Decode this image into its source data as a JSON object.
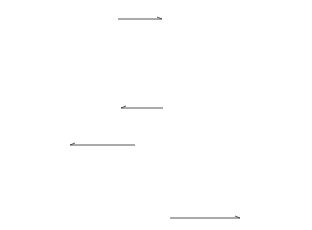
{
  "figure": {
    "colors": {
      "line": "#2a2a2a",
      "dashed": "#6a6a6a",
      "background": "#ffffff"
    },
    "labels": {
      "A": "A",
      "a": "a",
      "b": "b",
      "c": "c",
      "X": "X",
      "Y": "Y",
      "B": "B"
    },
    "panels": [
      {
        "id": "a",
        "rows": 8,
        "cols": 4,
        "shear": "down-right",
        "label": "a",
        "side_label": "A"
      },
      {
        "id": "b",
        "rows": 8,
        "cols": 4,
        "shear": "chevron",
        "label": "b",
        "boundaries": [
          "X",
          "Y"
        ],
        "arrows": [
          "top-right",
          "bottom-left"
        ]
      },
      {
        "id": "c",
        "rows": 8,
        "cols": 4,
        "shear": "down-left",
        "label": "c"
      },
      {
        "id": "B",
        "rows": 4,
        "cols": 8,
        "label": "B",
        "solid_cells_per_row": [
          [
            0,
            4
          ],
          [
            0,
            4
          ],
          [
            2,
            6
          ],
          [
            3,
            6
          ]
        ],
        "arrows": [
          "top-left",
          "bottom-right"
        ]
      }
    ]
  }
}
